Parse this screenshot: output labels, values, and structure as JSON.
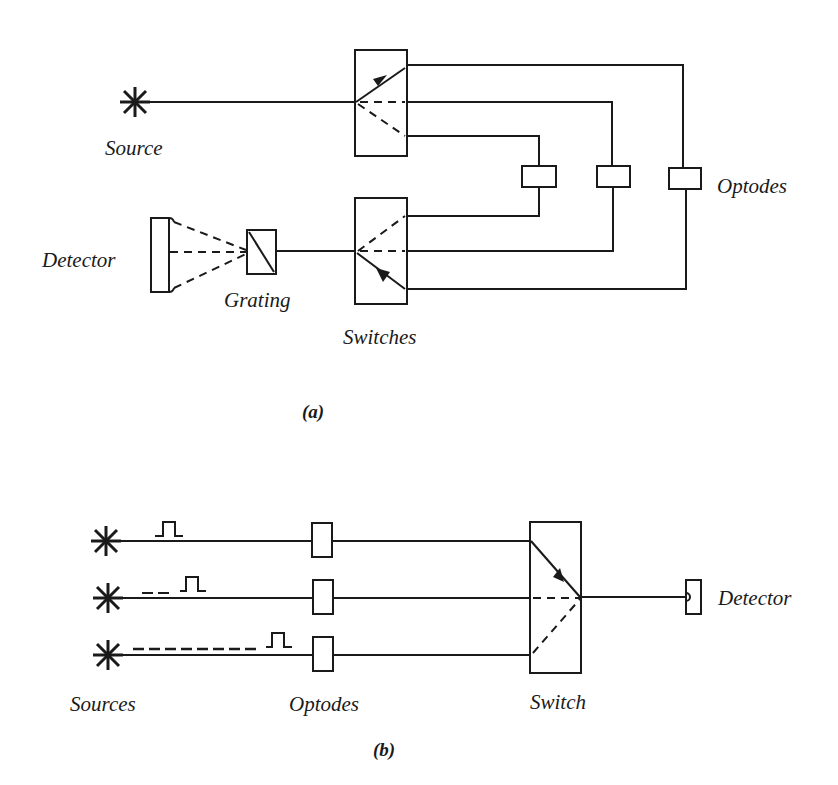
{
  "figure_a": {
    "caption": "(a)",
    "labels": {
      "source": "Source",
      "detector": "Detector",
      "grating": "Grating",
      "switches": "Switches",
      "optodes": "Optodes"
    },
    "optode_count": 3
  },
  "figure_b": {
    "caption": "(b)",
    "labels": {
      "sources": "Sources",
      "optodes": "Optodes",
      "switch": "Switch",
      "detector": "Detector"
    },
    "source_count": 3,
    "pulse_delays": [
      "none",
      "short delay",
      "long delay"
    ]
  },
  "colors": {
    "line": "#1a1a1a",
    "background": "#ffffff"
  }
}
